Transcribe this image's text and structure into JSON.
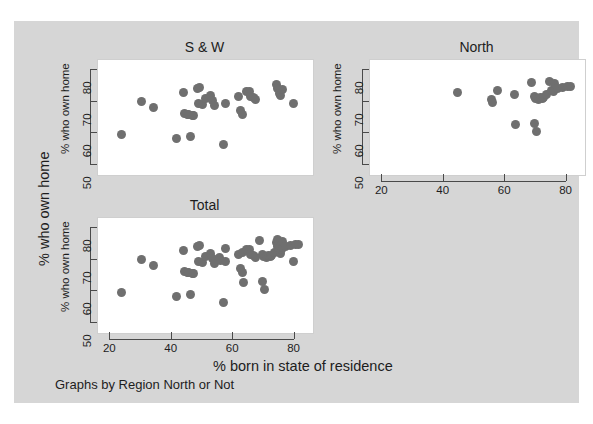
{
  "top_strip_ghost_text": "",
  "figure": {
    "background_color": "#d6d6d6",
    "panel_background_color": "#ffffff",
    "marker_color": "#6f6f6f",
    "axis_color": "#4a4a4a",
    "overall_ylabel": "% who own home",
    "overall_xlabel": "% born in state of residence",
    "note": "Graphs by Region North or Not"
  },
  "chart_data": [
    {
      "type": "scatter",
      "title": "S & W",
      "xlabel": "",
      "ylabel": "% who own home",
      "xlim": [
        16,
        86
      ],
      "ylim": [
        47,
        83
      ],
      "xticks": [
        20,
        40,
        60,
        80
      ],
      "yticks": [
        50,
        60,
        70,
        80
      ],
      "xticks_shown": false,
      "yticks_shown": true,
      "grid": false,
      "legend": "none",
      "points": [
        {
          "x": 23.5,
          "y": 59.6
        },
        {
          "x": 30.2,
          "y": 70.0
        },
        {
          "x": 34.2,
          "y": 68.2
        },
        {
          "x": 41.5,
          "y": 58.3
        },
        {
          "x": 43.8,
          "y": 72.9
        },
        {
          "x": 44.3,
          "y": 66.3
        },
        {
          "x": 45.3,
          "y": 65.9
        },
        {
          "x": 45.6,
          "y": 66.0
        },
        {
          "x": 46.0,
          "y": 59.0
        },
        {
          "x": 46.8,
          "y": 65.7
        },
        {
          "x": 47.0,
          "y": 65.6
        },
        {
          "x": 48.4,
          "y": 74.1
        },
        {
          "x": 49.2,
          "y": 74.3
        },
        {
          "x": 48.6,
          "y": 69.5
        },
        {
          "x": 50.0,
          "y": 69.0
        },
        {
          "x": 51.0,
          "y": 71.0
        },
        {
          "x": 52.6,
          "y": 71.8
        },
        {
          "x": 53.2,
          "y": 70.2
        },
        {
          "x": 54.0,
          "y": 68.9
        },
        {
          "x": 56.8,
          "y": 56.4
        },
        {
          "x": 57.6,
          "y": 69.4
        },
        {
          "x": 61.6,
          "y": 71.7
        },
        {
          "x": 62.3,
          "y": 67.2
        },
        {
          "x": 62.9,
          "y": 65.8
        },
        {
          "x": 64.4,
          "y": 73.1
        },
        {
          "x": 65.3,
          "y": 73.0
        },
        {
          "x": 65.8,
          "y": 71.6
        },
        {
          "x": 66.7,
          "y": 71.4
        },
        {
          "x": 67.3,
          "y": 70.6
        },
        {
          "x": 74.0,
          "y": 75.4
        },
        {
          "x": 74.6,
          "y": 74.0
        },
        {
          "x": 75.2,
          "y": 72.6
        },
        {
          "x": 75.4,
          "y": 71.9
        },
        {
          "x": 76.0,
          "y": 73.8
        },
        {
          "x": 79.5,
          "y": 69.3
        }
      ]
    },
    {
      "type": "scatter",
      "title": "North",
      "xlabel": "",
      "ylabel": "% who own home",
      "xlim": [
        16,
        86
      ],
      "ylim": [
        47,
        83
      ],
      "xticks": [
        20,
        40,
        60,
        80
      ],
      "yticks": [
        50,
        60,
        70,
        80
      ],
      "xticks_shown": true,
      "yticks_shown": true,
      "grid": false,
      "legend": "none",
      "points": [
        {
          "x": 44.6,
          "y": 72.9
        },
        {
          "x": 55.4,
          "y": 70.6
        },
        {
          "x": 55.8,
          "y": 69.6
        },
        {
          "x": 57.4,
          "y": 73.6
        },
        {
          "x": 62.9,
          "y": 72.2
        },
        {
          "x": 63.3,
          "y": 62.8
        },
        {
          "x": 68.5,
          "y": 75.9
        },
        {
          "x": 69.5,
          "y": 63.2
        },
        {
          "x": 69.4,
          "y": 71.5
        },
        {
          "x": 70.0,
          "y": 71.0
        },
        {
          "x": 70.3,
          "y": 60.7
        },
        {
          "x": 70.8,
          "y": 70.6
        },
        {
          "x": 71.4,
          "y": 71.2
        },
        {
          "x": 72.0,
          "y": 70.8
        },
        {
          "x": 72.6,
          "y": 71.3
        },
        {
          "x": 73.4,
          "y": 72.1
        },
        {
          "x": 74.6,
          "y": 76.4
        },
        {
          "x": 75.2,
          "y": 73.6
        },
        {
          "x": 75.6,
          "y": 73.2
        },
        {
          "x": 76.2,
          "y": 75.7
        },
        {
          "x": 77.0,
          "y": 74.0
        },
        {
          "x": 78.6,
          "y": 74.5
        },
        {
          "x": 80.2,
          "y": 74.8
        },
        {
          "x": 81.4,
          "y": 74.6
        }
      ]
    },
    {
      "type": "scatter",
      "title": "Total",
      "xlabel": "% born in state of residence",
      "ylabel": "% who own home",
      "xlim": [
        16,
        86
      ],
      "ylim": [
        47,
        83
      ],
      "xticks": [
        20,
        40,
        60,
        80
      ],
      "yticks": [
        50,
        60,
        70,
        80
      ],
      "xticks_shown": true,
      "yticks_shown": true,
      "grid": false,
      "legend": "none",
      "points": [
        {
          "x": 23.5,
          "y": 59.6
        },
        {
          "x": 30.2,
          "y": 70.0
        },
        {
          "x": 34.2,
          "y": 68.2
        },
        {
          "x": 41.5,
          "y": 58.3
        },
        {
          "x": 43.8,
          "y": 72.9
        },
        {
          "x": 44.3,
          "y": 66.3
        },
        {
          "x": 45.3,
          "y": 65.9
        },
        {
          "x": 45.6,
          "y": 66.0
        },
        {
          "x": 46.0,
          "y": 59.0
        },
        {
          "x": 46.8,
          "y": 65.7
        },
        {
          "x": 47.0,
          "y": 65.6
        },
        {
          "x": 48.4,
          "y": 74.1
        },
        {
          "x": 49.2,
          "y": 74.3
        },
        {
          "x": 48.6,
          "y": 69.5
        },
        {
          "x": 50.0,
          "y": 69.0
        },
        {
          "x": 51.0,
          "y": 71.0
        },
        {
          "x": 52.6,
          "y": 71.8
        },
        {
          "x": 53.2,
          "y": 70.2
        },
        {
          "x": 54.0,
          "y": 68.9
        },
        {
          "x": 55.4,
          "y": 70.6
        },
        {
          "x": 55.8,
          "y": 69.6
        },
        {
          "x": 56.8,
          "y": 56.4
        },
        {
          "x": 57.4,
          "y": 73.6
        },
        {
          "x": 57.6,
          "y": 69.4
        },
        {
          "x": 61.6,
          "y": 71.7
        },
        {
          "x": 62.3,
          "y": 67.2
        },
        {
          "x": 62.9,
          "y": 65.8
        },
        {
          "x": 62.9,
          "y": 72.2
        },
        {
          "x": 63.3,
          "y": 62.8
        },
        {
          "x": 64.4,
          "y": 73.1
        },
        {
          "x": 65.3,
          "y": 73.0
        },
        {
          "x": 65.8,
          "y": 71.6
        },
        {
          "x": 66.7,
          "y": 71.4
        },
        {
          "x": 67.3,
          "y": 70.6
        },
        {
          "x": 68.5,
          "y": 75.9
        },
        {
          "x": 69.4,
          "y": 71.5
        },
        {
          "x": 69.5,
          "y": 63.2
        },
        {
          "x": 70.0,
          "y": 71.0
        },
        {
          "x": 70.3,
          "y": 60.7
        },
        {
          "x": 70.8,
          "y": 70.6
        },
        {
          "x": 71.4,
          "y": 71.2
        },
        {
          "x": 72.0,
          "y": 70.8
        },
        {
          "x": 72.6,
          "y": 71.3
        },
        {
          "x": 73.4,
          "y": 72.1
        },
        {
          "x": 74.0,
          "y": 75.4
        },
        {
          "x": 74.6,
          "y": 76.4
        },
        {
          "x": 74.6,
          "y": 74.0
        },
        {
          "x": 75.2,
          "y": 72.6
        },
        {
          "x": 75.2,
          "y": 73.6
        },
        {
          "x": 75.4,
          "y": 71.9
        },
        {
          "x": 75.6,
          "y": 73.2
        },
        {
          "x": 76.0,
          "y": 73.8
        },
        {
          "x": 76.2,
          "y": 75.7
        },
        {
          "x": 77.0,
          "y": 74.0
        },
        {
          "x": 78.6,
          "y": 74.5
        },
        {
          "x": 79.5,
          "y": 69.3
        },
        {
          "x": 80.2,
          "y": 74.8
        },
        {
          "x": 81.4,
          "y": 74.6
        }
      ]
    }
  ]
}
